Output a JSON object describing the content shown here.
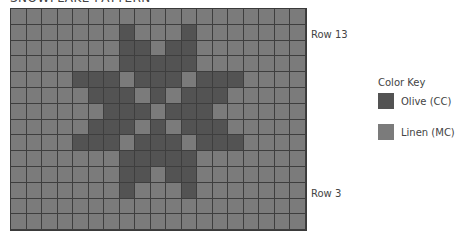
{
  "title": "SNOWFLAKE PATTERN",
  "colors": {
    "cc": "#535353",
    "mc": "#7b7b7b"
  },
  "grid": {
    "columns": 19,
    "rows": 14,
    "pattern": [
      [
        0,
        0,
        0,
        0,
        0,
        0,
        0,
        0,
        0,
        0,
        0,
        0,
        0,
        0,
        0,
        0,
        0,
        0,
        0
      ],
      [
        0,
        0,
        0,
        0,
        0,
        0,
        0,
        1,
        0,
        0,
        0,
        1,
        0,
        0,
        0,
        0,
        0,
        0,
        0
      ],
      [
        0,
        0,
        0,
        0,
        0,
        0,
        0,
        1,
        1,
        0,
        1,
        1,
        0,
        0,
        0,
        0,
        0,
        0,
        0
      ],
      [
        0,
        0,
        0,
        0,
        0,
        0,
        0,
        1,
        1,
        1,
        1,
        1,
        0,
        0,
        0,
        0,
        0,
        0,
        0
      ],
      [
        0,
        0,
        0,
        0,
        1,
        1,
        1,
        0,
        1,
        1,
        1,
        0,
        1,
        1,
        1,
        0,
        0,
        0,
        0
      ],
      [
        0,
        0,
        0,
        0,
        0,
        1,
        1,
        1,
        0,
        1,
        0,
        1,
        1,
        1,
        0,
        0,
        0,
        0,
        0
      ],
      [
        0,
        0,
        0,
        0,
        0,
        0,
        1,
        1,
        1,
        0,
        1,
        1,
        1,
        0,
        0,
        0,
        0,
        0,
        0
      ],
      [
        0,
        0,
        0,
        0,
        0,
        1,
        1,
        1,
        0,
        1,
        0,
        1,
        1,
        1,
        0,
        0,
        0,
        0,
        0
      ],
      [
        0,
        0,
        0,
        0,
        1,
        1,
        1,
        0,
        1,
        1,
        1,
        0,
        1,
        1,
        1,
        0,
        0,
        0,
        0
      ],
      [
        0,
        0,
        0,
        0,
        0,
        0,
        0,
        1,
        1,
        1,
        1,
        1,
        0,
        0,
        0,
        0,
        0,
        0,
        0
      ],
      [
        0,
        0,
        0,
        0,
        0,
        0,
        0,
        1,
        1,
        0,
        1,
        1,
        0,
        0,
        0,
        0,
        0,
        0,
        0
      ],
      [
        0,
        0,
        0,
        0,
        0,
        0,
        0,
        1,
        0,
        0,
        0,
        1,
        0,
        0,
        0,
        0,
        0,
        0,
        0
      ],
      [
        0,
        0,
        0,
        0,
        0,
        0,
        0,
        0,
        0,
        0,
        0,
        0,
        0,
        0,
        0,
        0,
        0,
        0,
        0
      ],
      [
        0,
        0,
        0,
        0,
        0,
        0,
        0,
        0,
        0,
        0,
        0,
        0,
        0,
        0,
        0,
        0,
        0,
        0,
        0
      ]
    ]
  },
  "row_labels": {
    "top": "Row 13",
    "bottom": "Row 3"
  },
  "legend": {
    "title": "Color Key",
    "items": [
      {
        "label": "Olive (CC)",
        "color": "#535353"
      },
      {
        "label": "Linen (MC)",
        "color": "#7b7b7b"
      }
    ]
  }
}
